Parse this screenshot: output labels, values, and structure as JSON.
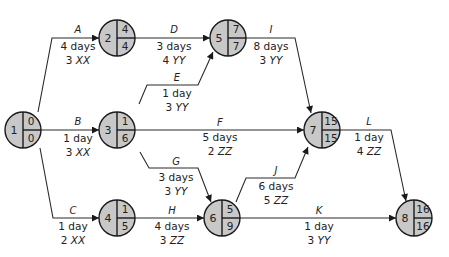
{
  "nodes": [
    {
      "id": "1",
      "early": "0",
      "late": "0",
      "cx": 23,
      "cy": 130
    },
    {
      "id": "2",
      "early": "4",
      "late": "4",
      "cx": 117,
      "cy": 38
    },
    {
      "id": "3",
      "early": "1",
      "late": "6",
      "cx": 117,
      "cy": 130
    },
    {
      "id": "4",
      "early": "1",
      "late": "5",
      "cx": 117,
      "cy": 218
    },
    {
      "id": "5",
      "early": "7",
      "late": "7",
      "cx": 228,
      "cy": 38
    },
    {
      "id": "6",
      "early": "5",
      "late": "9",
      "cx": 222,
      "cy": 218
    },
    {
      "id": "7",
      "early": "15",
      "late": "15",
      "cx": 322,
      "cy": 130
    },
    {
      "id": "8",
      "early": "16",
      "late": "16",
      "cx": 414,
      "cy": 218
    }
  ],
  "activities": [
    {
      "name": "A",
      "duration": "4 days",
      "res_qty": "3",
      "res_type": "XX",
      "from": "1",
      "to": "2"
    },
    {
      "name": "B",
      "duration": "1 day",
      "res_qty": "3",
      "res_type": "XX",
      "from": "1",
      "to": "3"
    },
    {
      "name": "C",
      "duration": "1 day",
      "res_qty": "2",
      "res_type": "XX",
      "from": "1",
      "to": "4"
    },
    {
      "name": "D",
      "duration": "3 days",
      "res_qty": "4",
      "res_type": "YY",
      "from": "2",
      "to": "5"
    },
    {
      "name": "E",
      "duration": "1 day",
      "res_qty": "3",
      "res_type": "YY",
      "from": "3",
      "to": "5"
    },
    {
      "name": "F",
      "duration": "5 days",
      "res_qty": "2",
      "res_type": "ZZ",
      "from": "3",
      "to": "7"
    },
    {
      "name": "G",
      "duration": "3 days",
      "res_qty": "3",
      "res_type": "YY",
      "from": "3",
      "to": "6"
    },
    {
      "name": "H",
      "duration": "4 days",
      "res_qty": "3",
      "res_type": "ZZ",
      "from": "4",
      "to": "6"
    },
    {
      "name": "I",
      "duration": "8 days",
      "res_qty": "3",
      "res_type": "YY",
      "from": "5",
      "to": "7"
    },
    {
      "name": "J",
      "duration": "6 days",
      "res_qty": "5",
      "res_type": "ZZ",
      "from": "6",
      "to": "7"
    },
    {
      "name": "K",
      "duration": "1 day",
      "res_qty": "3",
      "res_type": "YY",
      "from": "6",
      "to": "8"
    },
    {
      "name": "L",
      "duration": "1 day",
      "res_qty": "4",
      "res_type": "ZZ",
      "from": "7",
      "to": "8"
    }
  ],
  "colors": {
    "node_fill": "#c8c8c8",
    "stroke": "#1a1a1a",
    "background": "#ffffff"
  }
}
